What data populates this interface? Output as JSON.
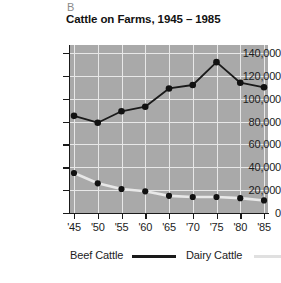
{
  "panel": {
    "letter": "B"
  },
  "title": "Cattle on Farms, 1945 – 1985",
  "axes": {
    "y_tick_labels": [
      "140,000",
      "120,000",
      "100,000",
      "80,000",
      "60,000",
      "40,000",
      "20,000",
      "0"
    ],
    "x_tick_labels": [
      "'45",
      "'50",
      "'55",
      "'60",
      "'65",
      "'70",
      "'75",
      "'80",
      "'85"
    ]
  },
  "legend": {
    "beef_label": "Beef Cattle",
    "dairy_label": "Dairy Cattle",
    "beef_color": "#1a1a1a",
    "dairy_color": "#e8e8e8"
  },
  "colors": {
    "plot_background": "#a9a9a9",
    "gridline": "#e8e8e8",
    "axis": "#1a1a1a",
    "text": "#1c1c1c",
    "panel_letter": "#8a8a8a"
  },
  "chart_data": {
    "type": "line",
    "title": "Cattle on Farms, 1945 – 1985",
    "xlabel": "",
    "ylabel": "",
    "categories": [
      "'45",
      "'50",
      "'55",
      "'60",
      "'65",
      "'70",
      "'75",
      "'80",
      "'85"
    ],
    "x_values": [
      1945,
      1950,
      1955,
      1960,
      1965,
      1970,
      1975,
      1980,
      1985
    ],
    "ylim": [
      0,
      140000
    ],
    "y_ticks": [
      0,
      20000,
      40000,
      60000,
      80000,
      100000,
      120000,
      140000
    ],
    "grid": true,
    "legend_position": "bottom",
    "series": [
      {
        "name": "Beef Cattle",
        "color": "#1a1a1a",
        "marker": "circle",
        "values": [
          85000,
          79000,
          89000,
          93000,
          109000,
          112000,
          132000,
          114000,
          110000
        ]
      },
      {
        "name": "Dairy Cattle",
        "color": "#e8e8e8",
        "marker": "circle",
        "values": [
          35000,
          26000,
          21000,
          19000,
          15000,
          14000,
          14000,
          13000,
          11000
        ]
      }
    ]
  }
}
